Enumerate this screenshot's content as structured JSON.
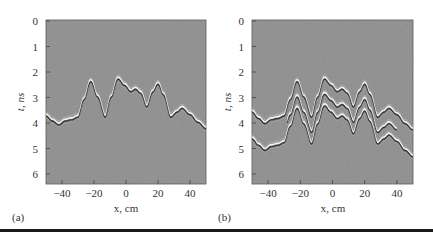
{
  "figure": {
    "background": "#ffffff",
    "plot_fill": "#8e8e8e",
    "wave_light": "#f2f2f2",
    "wave_dark": "#3a3a3a",
    "rule_color": "#1a1a1a"
  },
  "chart_data": [
    {
      "type": "heatmap",
      "panel_label": "(a)",
      "title": "",
      "xlabel": "x, cm",
      "ylabel": "t, ns",
      "xlim": [
        -50,
        50
      ],
      "ylim": [
        6.4,
        0
      ],
      "xticks": [
        -40,
        -20,
        0,
        20,
        40
      ],
      "xtick_labels": [
        "−40",
        "−20",
        "0",
        "20",
        "40"
      ],
      "yticks": [
        0,
        1,
        2,
        3,
        4,
        5,
        6
      ],
      "ytick_labels": [
        "0",
        "1",
        "2",
        "3",
        "4",
        "5",
        "6"
      ],
      "grid": false,
      "description": "Radargram (B-scan) showing a single reflected wavefront from an undulating interface",
      "wavefronts": [
        {
          "name": "primary reflection",
          "x": [
            -50,
            -46,
            -42,
            -38,
            -34,
            -30,
            -26,
            -22,
            -18,
            -13,
            -9,
            -5,
            -1,
            3,
            6,
            9,
            13,
            17,
            20,
            23,
            28,
            32,
            35,
            40,
            45,
            50
          ],
          "t": [
            3.65,
            3.85,
            4.0,
            3.85,
            3.8,
            3.7,
            3.0,
            2.3,
            2.9,
            3.7,
            2.9,
            2.2,
            2.45,
            2.7,
            2.6,
            2.75,
            3.3,
            2.7,
            2.4,
            2.8,
            3.7,
            3.5,
            3.35,
            3.6,
            3.9,
            4.15
          ]
        }
      ]
    },
    {
      "type": "heatmap",
      "panel_label": "(b)",
      "title": "",
      "xlabel": "x, cm",
      "ylabel": "t, ns",
      "xlim": [
        -50,
        50
      ],
      "ylim": [
        6.4,
        0
      ],
      "xticks": [
        -40,
        -20,
        0,
        20,
        40
      ],
      "xtick_labels": [
        "−40",
        "−20",
        "0",
        "20",
        "40"
      ],
      "yticks": [
        0,
        1,
        2,
        3,
        4,
        5,
        6
      ],
      "ytick_labels": [
        "0",
        "1",
        "2",
        "3",
        "4",
        "5",
        "6"
      ],
      "grid": false,
      "description": "Radargram (B-scan) showing the primary wavefront plus delayed multiple reflections",
      "wavefronts": [
        {
          "name": "primary reflection",
          "x": [
            -50,
            -46,
            -42,
            -38,
            -34,
            -30,
            -26,
            -22,
            -18,
            -13,
            -9,
            -5,
            -1,
            3,
            6,
            9,
            13,
            17,
            20,
            23,
            28,
            32,
            35,
            40,
            45,
            50
          ],
          "t": [
            3.5,
            3.75,
            3.95,
            3.8,
            3.75,
            3.65,
            3.0,
            2.3,
            2.9,
            3.7,
            2.9,
            2.2,
            2.45,
            2.7,
            2.6,
            2.75,
            3.3,
            2.7,
            2.4,
            2.8,
            3.7,
            3.5,
            3.35,
            3.6,
            3.95,
            4.2
          ]
        },
        {
          "name": "second reflection (+0.6 ns)",
          "offset_ns": 0.6,
          "x_range": [
            -28,
            40
          ]
        },
        {
          "name": "third reflection (+1.05 ns)",
          "offset_ns": 1.05,
          "x_range": [
            -50,
            50
          ]
        }
      ]
    }
  ]
}
